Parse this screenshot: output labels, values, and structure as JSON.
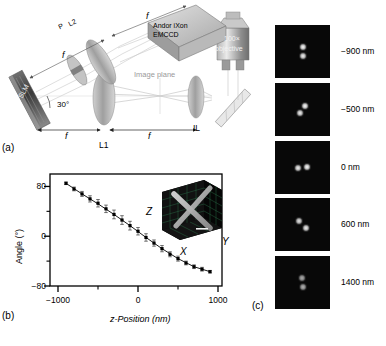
{
  "figure": {
    "panels": [
      {
        "id": "a",
        "letter": "(a)"
      },
      {
        "id": "b",
        "letter": "(b)"
      },
      {
        "id": "c",
        "letter": "(c)"
      }
    ]
  },
  "panel_a": {
    "letter": "(a)",
    "components": {
      "slm": "SLM",
      "camera_line1": "Andor iXon",
      "camera_line2": "EMCCD",
      "objective_line1": "100×",
      "objective_line2": "objective",
      "lens_l1": "L1",
      "lens_l2": "L2",
      "polarizer": "P",
      "imaging_lens": "IL",
      "image_plane": "Image plane"
    },
    "annotations": {
      "angle": "30°",
      "focal_1": "f",
      "focal_2": "f",
      "focal_3": "f",
      "focal_4": "f"
    }
  },
  "panel_b": {
    "letter": "(b)",
    "inset": {
      "axis_z": "Z",
      "axis_x": "X",
      "axis_y": "Y"
    }
  },
  "panel_c": {
    "letter": "(c)",
    "frames": [
      {
        "label": "−900 nm",
        "angle_deg": 90,
        "separation": 9,
        "brightness": 1.0
      },
      {
        "label": "−500 nm",
        "angle_deg": 50,
        "separation": 9,
        "brightness": 1.0
      },
      {
        "label": "0 nm",
        "angle_deg": 5,
        "separation": 9,
        "brightness": 1.0
      },
      {
        "label": "600 nm",
        "angle_deg": -42,
        "separation": 9,
        "brightness": 0.95
      },
      {
        "label": "1400 nm",
        "angle_deg": -88,
        "separation": 9,
        "brightness": 0.7
      }
    ]
  },
  "chart_data": {
    "type": "scatter",
    "title": "",
    "xlabel": "z-Position (nm)",
    "ylabel": "Angle (°)",
    "xlim": [
      -1100,
      1050
    ],
    "ylim": [
      -80,
      100
    ],
    "xticks": [
      -1000,
      0,
      1000
    ],
    "xtick_labels": [
      "−1000",
      "0",
      "1000"
    ],
    "xminorticks": [
      -500,
      500
    ],
    "yticks": [
      80,
      0,
      -80
    ],
    "ytick_labels": [
      "80",
      "0",
      "−80"
    ],
    "yminorticks": [
      40,
      -40
    ],
    "grid": false,
    "legend": null,
    "series": [
      {
        "name": "Measured angle",
        "marker": "square",
        "x": [
          -900,
          -800,
          -700,
          -600,
          -500,
          -400,
          -300,
          -200,
          -100,
          0,
          100,
          200,
          300,
          400,
          500,
          600,
          700,
          800,
          900
        ],
        "y": [
          85,
          76,
          68,
          60,
          53,
          44,
          35,
          26,
          17,
          8,
          -2,
          -11,
          -20,
          -29,
          -36,
          -43,
          -49,
          -53,
          -57
        ],
        "yerr": [
          2,
          3,
          4,
          5,
          6,
          6,
          7,
          7,
          7,
          6,
          6,
          5,
          5,
          4,
          4,
          3,
          3,
          3,
          2
        ]
      },
      {
        "name": "Fit",
        "marker": "line",
        "x": [
          -900,
          -700,
          -500,
          -300,
          -100,
          100,
          300,
          500,
          700,
          900
        ],
        "y": [
          85,
          68,
          52,
          35,
          17,
          -2,
          -20,
          -36,
          -49,
          -57
        ]
      }
    ]
  }
}
